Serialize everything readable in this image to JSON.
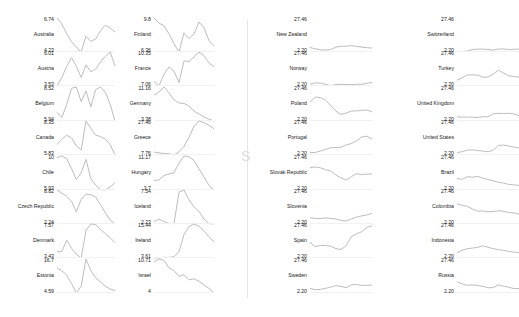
{
  "chart_data": [
    {
      "type": "line",
      "title": "",
      "layout": "small multiples, independent y-scale per panel",
      "grid": false,
      "panels": [
        {
          "name": "Australia",
          "max": "6.74",
          "min": "4.23",
          "values": [
            6.74,
            6.3,
            5.6,
            5.0,
            4.6,
            4.23,
            5.4,
            5.0,
            5.2,
            5.8,
            6.2,
            6.0,
            5.7
          ]
        },
        {
          "name": "Austria",
          "max": "6.01",
          "min": "3.53",
          "values": [
            3.6,
            4.2,
            5.0,
            5.6,
            5.0,
            4.2,
            5.1,
            4.6,
            4.8,
            5.3,
            5.7,
            6.01,
            5.0
          ]
        },
        {
          "name": "Belgium",
          "max": "8.52",
          "min": "5.94",
          "values": [
            6.6,
            6.2,
            7.2,
            8.4,
            8.5,
            7.4,
            8.2,
            7.0,
            8.3,
            8.5,
            8.1,
            7.2,
            5.94
          ]
        },
        {
          "name": "Canada",
          "max": "8.35",
          "min": "5.83",
          "values": [
            6.6,
            7.0,
            7.3,
            7.1,
            6.5,
            6.2,
            8.35,
            7.8,
            7.3,
            7.2,
            7.0,
            6.6,
            5.83
          ]
        },
        {
          "name": "Chile",
          "max": "10",
          "min": "5.93",
          "values": [
            9.8,
            10,
            9.7,
            8.5,
            7.2,
            8.0,
            9.6,
            7.3,
            6.5,
            6.0,
            5.93,
            6.3,
            6.8
          ]
        },
        {
          "name": "Czech Republic",
          "max": "8.82",
          "min": "2.24",
          "values": [
            8.8,
            8.2,
            7.6,
            6.6,
            4.6,
            7.0,
            8.0,
            7.9,
            7.4,
            6.0,
            4.4,
            3.0,
            2.24
          ]
        },
        {
          "name": "Denmark",
          "max": "7.57",
          "min": "3.43",
          "values": [
            4.2,
            4.2,
            5.6,
            4.6,
            3.9,
            3.43,
            6.8,
            7.57,
            7.5,
            6.9,
            6.4,
            5.9,
            5.3
          ]
        },
        {
          "name": "Estonia",
          "max": "16.7",
          "min": "4.59",
          "values": [
            13.5,
            12.5,
            11.0,
            8.0,
            4.59,
            7.0,
            16.7,
            12.5,
            10.0,
            8.5,
            7.0,
            6.0,
            5.5
          ]
        },
        {
          "name": "Finland",
          "max": "9.8",
          "min": "6.36",
          "values": [
            9.8,
            9.3,
            9.0,
            8.2,
            7.2,
            6.36,
            8.3,
            7.7,
            8.2,
            9.4,
            8.8,
            7.5,
            7.0
          ]
        },
        {
          "name": "France",
          "max": "10.35",
          "min": "7.06",
          "values": [
            7.5,
            7.06,
            8.2,
            8.9,
            8.5,
            7.4,
            9.5,
            9.4,
            9.9,
            10.35,
            10.0,
            9.3,
            8.9
          ]
        },
        {
          "name": "Germany",
          "max": "11.16",
          "min": "3.38",
          "values": [
            9.3,
            10.0,
            11.16,
            9.8,
            8.2,
            7.5,
            7.4,
            6.8,
            5.6,
            5.0,
            4.3,
            3.8,
            3.38
          ]
        },
        {
          "name": "Greece",
          "max": "27.46",
          "min": "7.76",
          "values": [
            9.5,
            9.0,
            8.6,
            8.5,
            7.76,
            9.6,
            12.7,
            17.9,
            24.4,
            27.46,
            26.5,
            24.9,
            23.0
          ]
        },
        {
          "name": "Hungary",
          "max": "11.17",
          "min": "3.7",
          "values": [
            5.8,
            5.9,
            6.9,
            7.2,
            7.5,
            9.6,
            11.17,
            11.0,
            10.2,
            8.3,
            6.6,
            4.7,
            3.7
          ]
        },
        {
          "name": "Iceland",
          "max": "7.54",
          "min": "2.23",
          "values": [
            2.6,
            3.0,
            2.6,
            2.3,
            2.3,
            7.2,
            7.54,
            6.0,
            4.9,
            4.2,
            3.0,
            2.3,
            2.23
          ]
        },
        {
          "name": "Ireland",
          "max": "15.44",
          "min": "3.61",
          "values": [
            4.3,
            4.4,
            4.5,
            4.5,
            4.7,
            6.4,
            12.0,
            14.6,
            15.44,
            14.7,
            13.1,
            11.3,
            9.5
          ]
        },
        {
          "name": "Israel",
          "max": "10.71",
          "min": "4",
          "values": [
            10.1,
            10.71,
            10.4,
            9.0,
            8.4,
            7.3,
            7.6,
            6.6,
            6.8,
            6.3,
            5.6,
            4.9,
            4.0
          ]
        },
        {
          "name": "New Zealand",
          "max": "27.46",
          "min": "2.20",
          "values": [
            5.5,
            4.6,
            3.9,
            3.7,
            4.0,
            5.8,
            6.5,
            6.5,
            6.9,
            6.4,
            5.8,
            5.4,
            5.1
          ]
        },
        {
          "name": "Norway",
          "max": "27.46",
          "min": "2.20",
          "values": [
            3.5,
            4.5,
            4.4,
            3.5,
            2.5,
            3.2,
            3.5,
            3.3,
            3.2,
            3.5,
            3.5,
            4.2,
            4.8
          ]
        },
        {
          "name": "Poland",
          "max": "27.46",
          "min": "2.20",
          "values": [
            16.1,
            19.9,
            19.6,
            17.7,
            13.8,
            9.6,
            7.1,
            8.1,
            9.6,
            9.7,
            10.1,
            10.3,
            9.0
          ]
        },
        {
          "name": "Portugal",
          "max": "27.46",
          "min": "2.20",
          "values": [
            4.0,
            4.1,
            5.1,
            6.4,
            7.6,
            7.7,
            8.0,
            9.6,
            10.8,
            12.7,
            15.5,
            16.2,
            14.1
          ]
        },
        {
          "name": "Slovak Republic",
          "max": "27.46",
          "min": "2.20",
          "values": [
            18.8,
            19.3,
            18.7,
            17.3,
            16.3,
            13.4,
            11.2,
            9.6,
            12.1,
            14.4,
            13.6,
            14.0,
            14.2
          ]
        },
        {
          "name": "Slovenia",
          "max": "27.46",
          "min": "2.20",
          "values": [
            6.9,
            6.3,
            6.3,
            6.7,
            6.3,
            6.0,
            4.9,
            4.4,
            5.9,
            7.3,
            8.2,
            8.9,
            10.1
          ]
        },
        {
          "name": "Spain",
          "max": "27.46",
          "min": "2.20",
          "values": [
            13.9,
            10.6,
            11.5,
            11.5,
            11.0,
            9.2,
            8.5,
            11.3,
            18.0,
            20.1,
            21.7,
            25.0,
            26.1
          ]
        },
        {
          "name": "Sweden",
          "max": "27.46",
          "min": "2.20",
          "values": [
            5.6,
            4.7,
            4.9,
            5.6,
            6.6,
            7.7,
            7.1,
            6.1,
            8.3,
            8.6,
            7.8,
            8.0,
            8.0
          ]
        },
        {
          "name": "Switzerland",
          "max": "27.46",
          "min": "2.20",
          "values": [
            2.7,
            2.5,
            2.9,
            4.1,
            4.3,
            4.4,
            4.0,
            3.6,
            4.4,
            4.5,
            4.0,
            4.2,
            4.4
          ]
        },
        {
          "name": "Turkey",
          "max": "27.46",
          "min": "2.20",
          "values": [
            6.5,
            8.4,
            10.4,
            10.5,
            10.3,
            8.8,
            8.8,
            11.0,
            14.0,
            11.9,
            9.8,
            9.2,
            8.7
          ]
        },
        {
          "name": "United Kingdom",
          "max": "27.46",
          "min": "2.20",
          "values": [
            5.4,
            5.0,
            5.1,
            5.0,
            4.8,
            5.4,
            5.3,
            7.5,
            7.9,
            7.8,
            7.9,
            7.5,
            6.1
          ]
        },
        {
          "name": "United States",
          "max": "27.46",
          "min": "2.20",
          "values": [
            4.0,
            4.7,
            5.8,
            6.0,
            5.5,
            5.1,
            4.6,
            5.8,
            9.3,
            9.6,
            8.9,
            8.1,
            7.4
          ]
        },
        {
          "name": "Brazil",
          "max": "27.46",
          "min": "2.20",
          "values": [
            10.8,
            10.1,
            12.1,
            11.7,
            12.3,
            11.0,
            10.0,
            9.0,
            8.0,
            7.3,
            6.4,
            6.0,
            5.6
          ]
        },
        {
          "name": "Colombia",
          "max": "27.46",
          "min": "2.20",
          "values": [
            17.2,
            16.1,
            15.3,
            13.3,
            11.7,
            11.9,
            11.3,
            11.5,
            12.0,
            11.6,
            10.8,
            10.4,
            9.6
          ]
        },
        {
          "name": "Indonesia",
          "max": "27.46",
          "min": "2.20",
          "values": [
            6.1,
            8.0,
            9.1,
            9.6,
            10.1,
            11.2,
            10.2,
            9.1,
            8.4,
            7.9,
            7.1,
            6.6,
            6.2
          ]
        },
        {
          "name": "Russia",
          "max": "27.46",
          "min": "2.20",
          "values": [
            10.6,
            9.0,
            7.9,
            8.2,
            7.8,
            7.1,
            6.1,
            6.2,
            8.2,
            7.3,
            6.5,
            5.5,
            5.5
          ]
        }
      ]
    }
  ],
  "columns": [
    {
      "panels": [
        0,
        1,
        2,
        3,
        4,
        5,
        6,
        7
      ]
    },
    {
      "panels": [
        8,
        9,
        10,
        11,
        12,
        13,
        14,
        15
      ]
    },
    {
      "panels": [
        16,
        17,
        18,
        19,
        20,
        21,
        22,
        23
      ]
    },
    {
      "panels": [
        24,
        25,
        26,
        27,
        28,
        29,
        30,
        31
      ]
    }
  ],
  "divider_glyph": "S",
  "line_color": "#bdbdbd"
}
